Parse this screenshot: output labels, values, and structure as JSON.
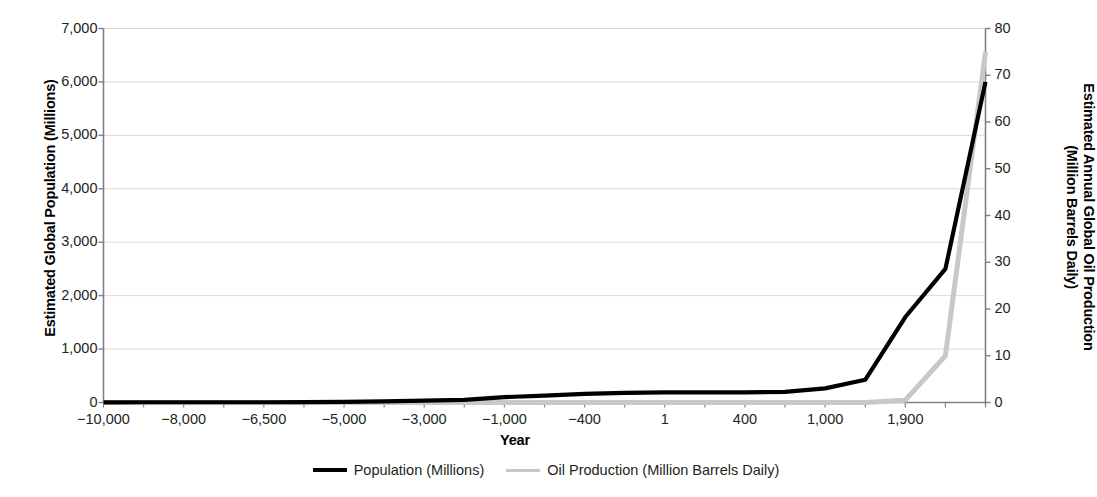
{
  "chart_data": {
    "type": "line",
    "title": "",
    "xlabel": "Year",
    "ylabel": "Estimated Global Population (Millions)",
    "y2label_line1": "Estimated Annual Global Oil Production",
    "y2label_line2": "(Million Barrels Daily)",
    "grid": true,
    "legend_position": "bottom",
    "ylim": [
      0,
      7000
    ],
    "y2lim": [
      0,
      80
    ],
    "yticks": [
      "0",
      "1,000",
      "2,000",
      "3,000",
      "4,000",
      "5,000",
      "6,000",
      "7,000"
    ],
    "ytick_values": [
      0,
      1000,
      2000,
      3000,
      4000,
      5000,
      6000,
      7000
    ],
    "y2ticks": [
      "0",
      "10",
      "20",
      "30",
      "40",
      "50",
      "60",
      "70",
      "80"
    ],
    "y2tick_values": [
      0,
      10,
      20,
      30,
      40,
      50,
      60,
      70,
      80
    ],
    "xticks": [
      "-10,000",
      "-8,000",
      "-6,500",
      "-5,000",
      "-3,000",
      "-1,000",
      "-400",
      "1",
      "400",
      "1,000",
      "1,900"
    ],
    "xtick_values": [
      -10000,
      -8000,
      -6500,
      -5000,
      -3000,
      -1000,
      -400,
      1,
      400,
      1000,
      1900
    ],
    "x_categories": [
      -10000,
      -9000,
      -8000,
      -7000,
      -6500,
      -6000,
      -5000,
      -4000,
      -3000,
      -2000,
      -1000,
      -700,
      -400,
      -200,
      1,
      200,
      400,
      700,
      1000,
      1500,
      1900,
      1950,
      2000
    ],
    "series": [
      {
        "name": "Population (Millions)",
        "axis": "left",
        "color": "#000000",
        "width": 4.2,
        "values": [
          4,
          5,
          5,
          5,
          5,
          7,
          10,
          20,
          35,
          50,
          100,
          130,
          160,
          180,
          190,
          190,
          190,
          200,
          265,
          425,
          1600,
          2500,
          6000
        ]
      },
      {
        "name": "Oil Production (Million Barrels Daily)",
        "axis": "right",
        "color": "#c8c8c8",
        "width": 5.0,
        "values": [
          0,
          0,
          0,
          0,
          0,
          0,
          0,
          0,
          0,
          0,
          0,
          0,
          0,
          0,
          0,
          0,
          0,
          0,
          0,
          0,
          0.5,
          10,
          75
        ]
      }
    ],
    "annotations": []
  },
  "legend": {
    "entries": [
      {
        "label": "Population (Millions)",
        "color": "#000000",
        "style": "thick"
      },
      {
        "label": "Oil Production (Million Barrels Daily)",
        "color": "#c6c6c6",
        "style": "thin"
      }
    ]
  },
  "colors": {
    "population": "#000000",
    "oil": "#c6c6c6",
    "grid": "#d9d9d9",
    "axis": "#808080",
    "text": "#231f20",
    "background": "#ffffff"
  }
}
